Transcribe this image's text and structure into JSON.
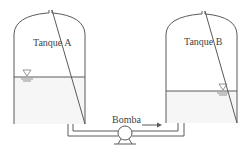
{
  "diagram": {
    "tank_a": {
      "label": "Tanque A",
      "water_level_symbol": "▽"
    },
    "tank_b": {
      "label": "Tanque B",
      "water_level_symbol": "▽"
    },
    "pump": {
      "label": "Bomba"
    },
    "flow_direction": "right",
    "colors": {
      "line": "#5a5a5a",
      "text": "#444444",
      "water": "#f6f6f6"
    }
  }
}
